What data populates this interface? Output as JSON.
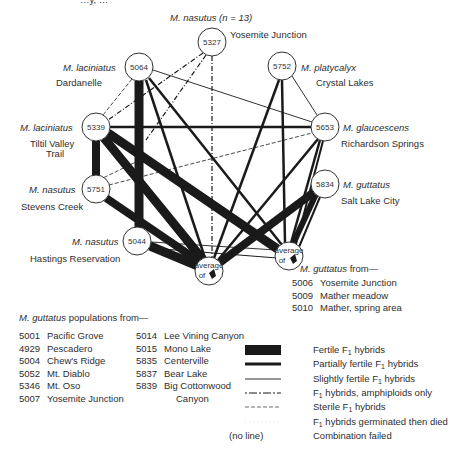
{
  "top_cropped_text": "…y, …",
  "nodes": [
    {
      "id": "5327",
      "species": "M. nasutus (n = 13)",
      "locality": "Yosemite Junction"
    },
    {
      "id": "5064",
      "species": "M. laciniatus",
      "locality": "Dardanelle"
    },
    {
      "id": "5752",
      "species": "M. platycalyx",
      "locality": "Crystal Lakes"
    },
    {
      "id": "5339",
      "species": "M. laciniatus",
      "locality_line1": "Tiltil Valley",
      "locality_line2": "Trail"
    },
    {
      "id": "5653",
      "species": "M. glaucescens",
      "locality": "Richardson Springs"
    },
    {
      "id": "5751",
      "species": "M. nasutus",
      "locality": "Stevens Creek"
    },
    {
      "id": "5834",
      "species": "M. guttatus",
      "locality": "Salt Lake City"
    },
    {
      "id": "5044",
      "species": "M. nasutus",
      "locality": "Hastings Reservation"
    },
    {
      "id": "avg-left",
      "label_line1": "average",
      "label_line2": "of"
    },
    {
      "id": "avg-right",
      "label_line1": "average",
      "label_line2": "of"
    }
  ],
  "right_group": {
    "heading_species": "M. guttatus",
    "heading_suffix": " from—",
    "items": [
      {
        "code": "5006",
        "name": "Yosemite Junction"
      },
      {
        "code": "5009",
        "name": "Mather meadow"
      },
      {
        "code": "5010",
        "name": "Mather, spring area"
      }
    ]
  },
  "populations": {
    "heading_species": "M. guttatus",
    "heading_suffix": " populations from—",
    "col1": [
      {
        "code": "5001",
        "name": "Pacific Grove"
      },
      {
        "code": "4929",
        "name": "Pescadero"
      },
      {
        "code": "5004",
        "name": "Chew's Ridge"
      },
      {
        "code": "5052",
        "name": "Mt. Diablo"
      },
      {
        "code": "5346",
        "name": "Mt. Oso"
      },
      {
        "code": "5007",
        "name": "Yosemite Junction"
      }
    ],
    "col2": [
      {
        "code": "5014",
        "name": "Lee Vining Canyon"
      },
      {
        "code": "5015",
        "name": "Mono Lake"
      },
      {
        "code": "5835",
        "name": "Centerville"
      },
      {
        "code": "5837",
        "name": "Bear Lake"
      },
      {
        "code": "5839",
        "name": "Big Cottonwood",
        "name2": "Canyon"
      }
    ]
  },
  "legend": [
    {
      "style": "fertile",
      "pre": "Fertile F",
      "sub": "1",
      "post": " hybrids"
    },
    {
      "style": "partial",
      "pre": "Partially fertile F",
      "sub": "1",
      "post": " hybrids"
    },
    {
      "style": "slight",
      "pre": "Slightly fertile F",
      "sub": "1",
      "post": " hybrids"
    },
    {
      "style": "amphiploid",
      "pre": "F",
      "sub": "1",
      "post": " hybrids, amphiploids only"
    },
    {
      "style": "sterile",
      "pre": "Sterile F",
      "sub": "1",
      "post": " hybrids"
    },
    {
      "style": "died",
      "pre": "F",
      "sub": "1",
      "post": " hybrids germinated then died"
    },
    {
      "style": "none",
      "swatch_text": "(no line)",
      "pre": "Combination failed",
      "sub": "",
      "post": ""
    }
  ],
  "colors": {
    "ink": "#1a1a1a",
    "text": "#2e2e2e",
    "background": "#ffffff"
  }
}
